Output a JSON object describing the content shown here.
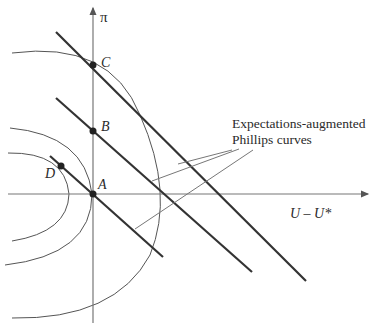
{
  "figure": {
    "y_axis_label": "π",
    "x_axis_label": "U – U*",
    "points": [
      {
        "name": "C",
        "label": "C"
      },
      {
        "name": "B",
        "label": "B"
      },
      {
        "name": "A",
        "label": "A"
      },
      {
        "name": "D",
        "label": "D"
      }
    ],
    "annotation": {
      "line1": "Expectations-augmented",
      "line2": "Phillips curves"
    },
    "colors": {
      "axis": "#777777",
      "phillips_curve": "#333333",
      "indifference_curve": "#555555",
      "text": "#2a2a2a"
    }
  }
}
